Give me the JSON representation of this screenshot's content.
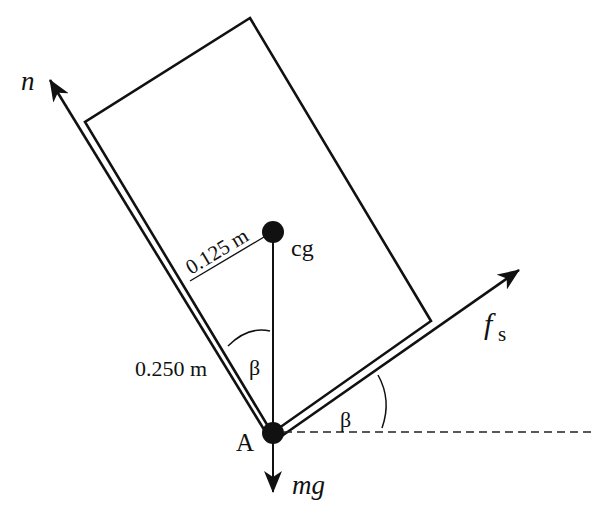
{
  "diagram": {
    "type": "free-body-diagram",
    "colors": {
      "ink": "#111111",
      "background": "#ffffff"
    },
    "labels": {
      "normal_force": "n",
      "friction_force": "f",
      "friction_subscript": "s",
      "weight": "mg",
      "pivot_point": "A",
      "center_of_gravity": "cg",
      "angle_left": "β",
      "angle_right": "β",
      "half_width": "0.125 m",
      "height_to_cg": "0.250 m"
    },
    "elements": {
      "block": {
        "shape": "rectangle",
        "corners": [
          [
            250,
            18
          ],
          [
            431,
            321
          ],
          [
            272,
            433
          ],
          [
            85,
            122
          ]
        ]
      },
      "point_A": {
        "x": 273,
        "y": 433,
        "radius": 11
      },
      "point_cg": {
        "x": 273,
        "y": 232,
        "radius": 11
      },
      "vector_n": {
        "from": [
          269,
          432
        ],
        "to": [
          46,
          73
        ]
      },
      "vector_fs": {
        "from": [
          274,
          437
        ],
        "to": [
          523,
          267
        ]
      },
      "vector_mg": {
        "from": [
          273,
          433
        ],
        "to": [
          273,
          493
        ]
      },
      "horizontal_reference": {
        "from": [
          284,
          432
        ],
        "to": [
          592,
          432
        ],
        "style": "dashed"
      }
    }
  }
}
